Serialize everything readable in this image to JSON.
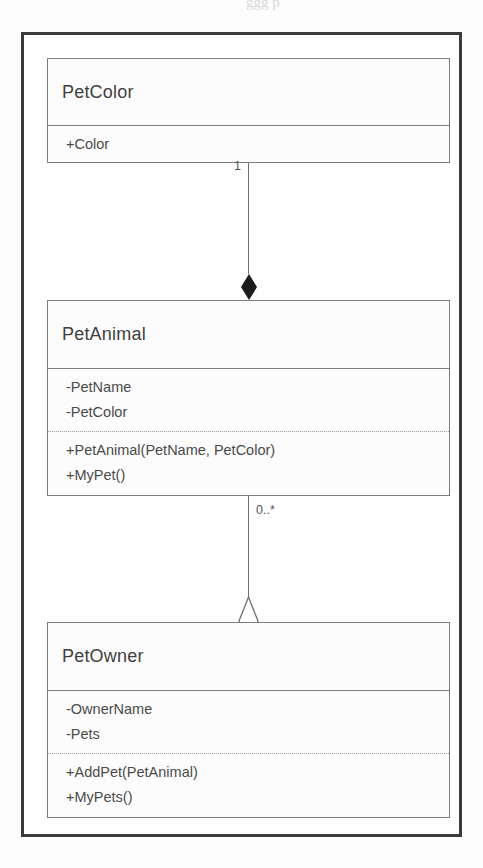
{
  "page": {
    "bleed_text": "ggg p",
    "background_color": "#fdfdfd"
  },
  "diagram": {
    "type": "uml-class-diagram",
    "frame_color": "#3b3b3b",
    "box_border_color": "#7d7d7d",
    "connector_color": "#6e6e6e",
    "classes": [
      {
        "name": "PetColor",
        "attributes": [
          "+Color"
        ],
        "operations": []
      },
      {
        "name": "PetAnimal",
        "attributes": [
          "-PetName",
          "-PetColor"
        ],
        "operations": [
          "+PetAnimal(PetName, PetColor)",
          "+MyPet()"
        ]
      },
      {
        "name": "PetOwner",
        "attributes": [
          "-OwnerName",
          "-Pets"
        ],
        "operations": [
          "+AddPet(PetAnimal)",
          "+MyPets()"
        ]
      }
    ],
    "relationships": [
      {
        "from": "PetColor",
        "to": "PetAnimal",
        "kind": "composition",
        "marker": "filled-diamond",
        "multiplicity": "1"
      },
      {
        "from": "PetAnimal",
        "to": "PetOwner",
        "kind": "aggregation",
        "marker": "hollow-diamond",
        "multiplicity": "0..*"
      }
    ]
  }
}
